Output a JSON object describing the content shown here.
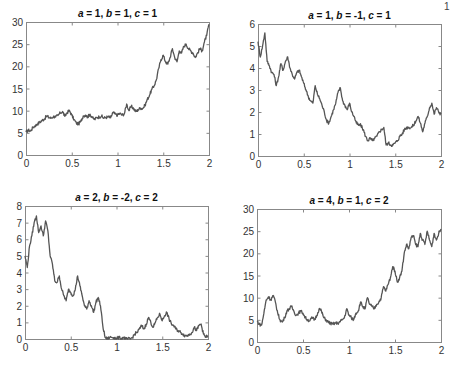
{
  "figure": {
    "width": 457,
    "height": 366,
    "line_color": "#555555",
    "axis_color": "#888888",
    "background": "#ffffff"
  },
  "chart_data": [
    {
      "type": "line",
      "id": "tl",
      "title": "a = 1, b = 1, c = 1",
      "title_parts": [
        {
          "t": "a",
          "i": true
        },
        {
          "t": " = 1, ",
          "i": false
        },
        {
          "t": "b",
          "i": true
        },
        {
          "t": " = 1, ",
          "i": false
        },
        {
          "t": "c",
          "i": true
        },
        {
          "t": " = 1",
          "i": false
        }
      ],
      "box": {
        "x0": 26,
        "y0": 22,
        "x1": 209,
        "y1": 155
      },
      "xlim": [
        0,
        2
      ],
      "ylim": [
        0,
        30
      ],
      "xticks": [
        0,
        0.5,
        1,
        1.5,
        2
      ],
      "xtick_labels": [
        "0",
        "0.5",
        "1",
        "1.5",
        "2"
      ],
      "yticks": [
        0,
        5,
        10,
        15,
        20,
        25,
        30
      ],
      "ytick_labels": [
        "0",
        "5",
        "10",
        "15",
        "20",
        "25",
        "30"
      ],
      "xlabel": "",
      "ylabel": "",
      "grid": false,
      "x_step": 0.025,
      "values": [
        5.2,
        5.6,
        5.4,
        6.2,
        6.6,
        7.0,
        7.4,
        7.8,
        8.1,
        8.8,
        8.5,
        8.3,
        8.7,
        8.6,
        8.9,
        9.5,
        9.8,
        8.7,
        9.6,
        10.0,
        9.0,
        8.0,
        7.2,
        7.0,
        7.6,
        8.8,
        9.0,
        8.6,
        9.2,
        8.4,
        8.0,
        8.5,
        8.6,
        8.8,
        8.3,
        8.5,
        8.6,
        8.4,
        9.6,
        9.2,
        9.0,
        9.4,
        9.0,
        9.3,
        11.5,
        10.0,
        11.0,
        10.5,
        9.8,
        10.2,
        10.6,
        10.5,
        11.2,
        12.5,
        13.5,
        14.8,
        15.6,
        17.0,
        19.5,
        21.5,
        22.5,
        21.0,
        20.5,
        22.0,
        24.0,
        22.0,
        21.0,
        23.5,
        23.0,
        24.5,
        25.0,
        24.0,
        23.5,
        23.0,
        22.0,
        23.0,
        24.0,
        23.5,
        25.5,
        27.0,
        29.5
      ]
    },
    {
      "type": "line",
      "id": "tr",
      "title": "a = 1, b = -1, c = 1",
      "title_parts": [
        {
          "t": "a",
          "i": true
        },
        {
          "t": " = 1, ",
          "i": false
        },
        {
          "t": "b",
          "i": true
        },
        {
          "t": " = -1, ",
          "i": false
        },
        {
          "t": "c",
          "i": true
        },
        {
          "t": " = 1",
          "i": false
        }
      ],
      "box": {
        "x0": 258,
        "y0": 24,
        "x1": 441,
        "y1": 156
      },
      "xlim": [
        0,
        2
      ],
      "ylim": [
        0,
        6
      ],
      "xticks": [
        0,
        0.5,
        1,
        1.5,
        2
      ],
      "xtick_labels": [
        "0",
        "0.5",
        "1",
        "1.5",
        "2"
      ],
      "yticks": [
        0,
        1,
        2,
        3,
        4,
        5,
        6
      ],
      "ytick_labels": [
        "0",
        "1",
        "2",
        "3",
        "4",
        "5",
        "6"
      ],
      "xlabel": "",
      "ylabel": "",
      "grid": false,
      "x_step": 0.025,
      "values": [
        5.2,
        4.5,
        5.0,
        5.6,
        4.3,
        4.1,
        3.8,
        3.7,
        3.2,
        3.6,
        4.2,
        3.9,
        4.3,
        4.5,
        4.0,
        3.7,
        3.5,
        3.8,
        3.9,
        3.6,
        3.3,
        3.0,
        2.7,
        2.5,
        2.4,
        3.2,
        2.8,
        2.6,
        2.3,
        2.0,
        1.6,
        1.5,
        1.8,
        2.1,
        2.4,
        2.9,
        3.1,
        2.5,
        2.3,
        2.1,
        2.4,
        2.0,
        1.8,
        1.5,
        1.4,
        1.4,
        1.2,
        0.9,
        0.7,
        0.8,
        0.7,
        0.8,
        0.9,
        1.1,
        1.2,
        1.3,
        0.5,
        0.6,
        0.5,
        0.5,
        0.6,
        0.7,
        0.9,
        1.0,
        1.2,
        1.3,
        1.3,
        1.3,
        1.4,
        1.6,
        1.8,
        1.5,
        1.1,
        1.5,
        1.8,
        2.2,
        2.4,
        1.9,
        2.2,
        2.0,
        1.9
      ]
    },
    {
      "type": "line",
      "id": "bl",
      "title": "a = 2, b = -2, c = 2",
      "title_parts": [
        {
          "t": "a",
          "i": true
        },
        {
          "t": " = 2, ",
          "i": false
        },
        {
          "t": "b",
          "i": true
        },
        {
          "t": " = -2, ",
          "i": false
        },
        {
          "t": "c",
          "i": true
        },
        {
          "t": " = 2",
          "i": false
        }
      ],
      "box": {
        "x0": 25,
        "y0": 206,
        "x1": 208,
        "y1": 339
      },
      "xlim": [
        0,
        2
      ],
      "ylim": [
        0,
        8
      ],
      "xticks": [
        0,
        0.5,
        1,
        1.5,
        2
      ],
      "xtick_labels": [
        "0",
        "0.5",
        "1",
        "1.5",
        "2"
      ],
      "yticks": [
        0,
        1,
        2,
        3,
        4,
        5,
        6,
        7,
        8
      ],
      "ytick_labels": [
        "0",
        "1",
        "2",
        "3",
        "4",
        "5",
        "6",
        "7",
        "8"
      ],
      "xlabel": "",
      "ylabel": "",
      "grid": false,
      "x_step": 0.025,
      "values": [
        5.0,
        4.3,
        5.6,
        6.2,
        7.0,
        7.4,
        6.4,
        6.8,
        6.2,
        7.1,
        6.5,
        5.0,
        4.5,
        3.5,
        3.4,
        3.8,
        3.0,
        2.6,
        2.3,
        3.0,
        2.8,
        2.6,
        3.0,
        3.8,
        3.2,
        2.6,
        2.0,
        1.8,
        2.3,
        2.0,
        1.6,
        2.2,
        2.5,
        2.0,
        0.8,
        0.1,
        0.0,
        0.1,
        0.1,
        0.1,
        0.0,
        0.1,
        0.0,
        0.1,
        0.0,
        0.0,
        0.0,
        0.1,
        0.3,
        0.4,
        0.6,
        0.8,
        0.6,
        0.9,
        1.3,
        1.0,
        0.7,
        1.0,
        1.3,
        1.5,
        1.1,
        1.4,
        1.6,
        1.2,
        0.9,
        0.8,
        0.6,
        0.5,
        0.4,
        0.3,
        0.2,
        0.2,
        0.3,
        0.4,
        0.7,
        0.5,
        0.8,
        0.9,
        0.3,
        0.1,
        0.2
      ]
    },
    {
      "type": "line",
      "id": "br",
      "title": "a = 4, b = 1, c = 2",
      "title_parts": [
        {
          "t": "a",
          "i": true
        },
        {
          "t": " = 4, ",
          "i": false
        },
        {
          "t": "b",
          "i": true
        },
        {
          "t": " = 1, ",
          "i": false
        },
        {
          "t": "c",
          "i": true
        },
        {
          "t": " = 2",
          "i": false
        }
      ],
      "box": {
        "x0": 257,
        "y0": 209,
        "x1": 441,
        "y1": 342
      },
      "xlim": [
        0,
        2
      ],
      "ylim": [
        0,
        30
      ],
      "xticks": [
        0,
        0.5,
        1,
        1.5,
        2
      ],
      "xtick_labels": [
        "0",
        "0.5",
        "1",
        "1.5",
        "2"
      ],
      "yticks": [
        0,
        5,
        10,
        15,
        20,
        25,
        30
      ],
      "ytick_labels": [
        "0",
        "5",
        "10",
        "15",
        "20",
        "25",
        "30"
      ],
      "xlabel": "",
      "ylabel": "",
      "grid": false,
      "x_step": 0.025,
      "values": [
        4.8,
        4.0,
        3.8,
        6.5,
        9.5,
        10.2,
        9.5,
        10.5,
        9.0,
        6.5,
        5.0,
        4.5,
        5.5,
        7.0,
        7.5,
        8.0,
        7.0,
        6.0,
        6.5,
        7.0,
        6.5,
        5.5,
        5.0,
        4.8,
        5.5,
        5.0,
        6.0,
        7.5,
        7.0,
        5.5,
        5.0,
        4.5,
        4.2,
        4.0,
        4.3,
        4.2,
        4.5,
        5.0,
        5.5,
        7.5,
        6.0,
        5.5,
        5.0,
        6.5,
        7.0,
        9.0,
        8.0,
        7.5,
        10.0,
        8.5,
        8.0,
        7.5,
        8.5,
        9.0,
        10.0,
        12.5,
        11.5,
        13.0,
        14.5,
        17.0,
        16.0,
        13.5,
        14.5,
        16.0,
        20.0,
        22.0,
        21.0,
        23.5,
        24.0,
        22.0,
        21.5,
        24.5,
        23.0,
        22.0,
        25.0,
        23.0,
        21.5,
        24.5,
        23.0,
        24.5,
        25.5
      ]
    }
  ],
  "edge_text": "1"
}
